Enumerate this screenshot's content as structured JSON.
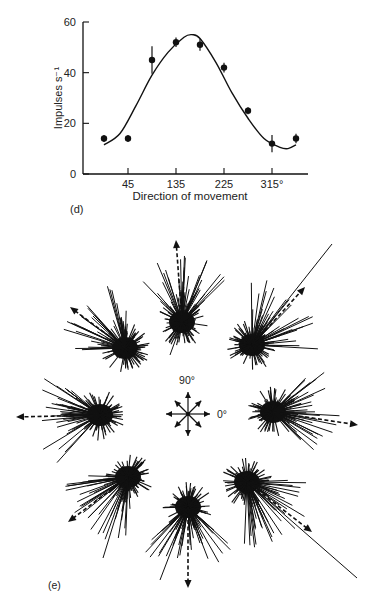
{
  "chart_data": [
    {
      "panel": "(d)",
      "type": "scatter",
      "title": "",
      "xlabel": "Direction of movement",
      "ylabel": "Impulses s⁻¹",
      "x_ticks": [
        45,
        135,
        225,
        315
      ],
      "x_tick_labels": [
        "45",
        "135",
        "225",
        "315°"
      ],
      "y_ticks": [
        0,
        20,
        40,
        60
      ],
      "y_tick_labels": [
        "0",
        "20",
        "40",
        "60"
      ],
      "ylim": [
        0,
        60
      ],
      "xlim": [
        -15,
        375
      ],
      "grid": false,
      "legend": null,
      "x": [
        0,
        45,
        90,
        135,
        180,
        225,
        270,
        315,
        360
      ],
      "values": [
        14,
        14,
        45,
        52,
        51,
        42,
        25,
        12,
        14
      ],
      "error": [
        1,
        1,
        5,
        1.5,
        2,
        1.5,
        1,
        3,
        1.5
      ],
      "fit_curve": {
        "type": "cosine-like tuning curve",
        "x": [
          0,
          30,
          60,
          90,
          120,
          150,
          165,
          180,
          210,
          240,
          270,
          300,
          330,
          345,
          360
        ],
        "values": [
          11.5,
          16,
          27,
          39,
          48,
          54,
          55,
          53.5,
          44,
          32,
          22,
          14,
          10.5,
          10,
          11.5
        ]
      }
    },
    {
      "panel": "(e)",
      "type": "scatter",
      "title": "",
      "description": "Raster of vectors (spike-train directions) for 8 movement directions arranged around a central compass; dashed arrow in each cluster shows population vector",
      "compass_labels": [
        "90°",
        "0°"
      ],
      "directions_deg": [
        0,
        45,
        90,
        135,
        180,
        225,
        270,
        315
      ],
      "clusters": [
        {
          "direction": 0,
          "cx": 273,
          "cy": 412,
          "arrow_tip": [
            358,
            425
          ]
        },
        {
          "direction": 45,
          "cx": 252,
          "cy": 345,
          "arrow_tip": [
            305,
            287
          ]
        },
        {
          "direction": 90,
          "cx": 182,
          "cy": 322,
          "arrow_tip": [
            176,
            240
          ]
        },
        {
          "direction": 135,
          "cx": 125,
          "cy": 348,
          "arrow_tip": [
            70,
            307
          ]
        },
        {
          "direction": 180,
          "cx": 100,
          "cy": 415,
          "arrow_tip": [
            16,
            417
          ]
        },
        {
          "direction": 225,
          "cx": 128,
          "cy": 477,
          "arrow_tip": [
            68,
            522
          ]
        },
        {
          "direction": 270,
          "cx": 188,
          "cy": 507,
          "arrow_tip": [
            188,
            588
          ]
        },
        {
          "direction": 315,
          "cx": 247,
          "cy": 482,
          "arrow_tip": [
            312,
            532
          ]
        }
      ]
    }
  ],
  "labels": {
    "panel_d": "(d)",
    "panel_e": "(e)",
    "xlabel": "Direction of movement",
    "ylabel": "Impulses s⁻¹",
    "compass_90": "90°",
    "compass_0": "0°"
  }
}
